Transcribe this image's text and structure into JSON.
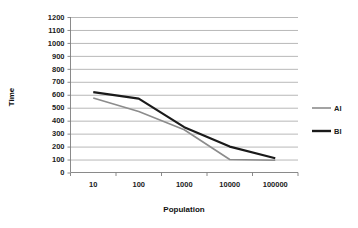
{
  "chart_data": {
    "type": "line",
    "title": "",
    "xlabel": "Population",
    "ylabel": "Time",
    "categories": [
      "10",
      "100",
      "1000",
      "10000",
      "100000"
    ],
    "ylim": [
      0,
      1200
    ],
    "ytick_step": 100,
    "yticks": [
      "0",
      "100",
      "200",
      "300",
      "400",
      "500",
      "600",
      "700",
      "800",
      "900",
      "1000",
      "1100",
      "1200"
    ],
    "grid": true,
    "legend_position": "right",
    "series": [
      {
        "name": "AI",
        "color": "#8c8c8c",
        "values": [
          575,
          470,
          330,
          100,
          95
        ]
      },
      {
        "name": "BI",
        "color": "#1a1a1a",
        "values": [
          620,
          570,
          350,
          200,
          110
        ]
      }
    ]
  },
  "legend": {
    "items": [
      {
        "label": "AI",
        "color": "#8c8c8c"
      },
      {
        "label": "BI",
        "color": "#1a1a1a"
      }
    ]
  },
  "axes": {
    "x_title": "Population",
    "y_title": "Time"
  }
}
